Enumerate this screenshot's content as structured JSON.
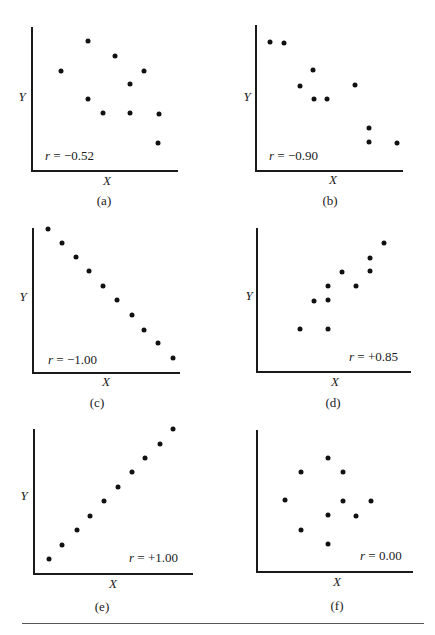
{
  "chart_data": [
    {
      "id": "a",
      "type": "scatter",
      "caption": "(a)",
      "xlabel": "X",
      "ylabel": "Y",
      "annotation": "r = −0.52",
      "r": -0.52,
      "grid": false,
      "ticks": false,
      "annotation_position": "bottom-left",
      "points": [
        [
          29,
          100
        ],
        [
          56,
          130
        ],
        [
          83,
          115
        ],
        [
          112,
          100
        ],
        [
          98,
          87
        ],
        [
          56,
          72
        ],
        [
          71,
          58
        ],
        [
          98,
          58
        ],
        [
          127,
          57
        ],
        [
          126,
          28
        ]
      ]
    },
    {
      "id": "b",
      "type": "scatter",
      "caption": "(b)",
      "xlabel": "X",
      "ylabel": "Y",
      "annotation": "r = −0.90",
      "r": -0.9,
      "grid": false,
      "ticks": false,
      "annotation_position": "bottom-left",
      "points": [
        [
          14,
          129
        ],
        [
          28,
          128
        ],
        [
          57,
          101
        ],
        [
          44,
          85
        ],
        [
          99,
          86
        ],
        [
          58,
          72
        ],
        [
          71,
          72
        ],
        [
          113,
          43
        ],
        [
          113,
          29
        ],
        [
          141,
          28
        ]
      ]
    },
    {
      "id": "c",
      "type": "scatter",
      "caption": "(c)",
      "xlabel": "X",
      "ylabel": "Y",
      "annotation": "r = −1.00",
      "r": -1.0,
      "grid": false,
      "ticks": false,
      "annotation_position": "bottom-left",
      "points": [
        [
          15,
          144
        ],
        [
          29,
          130
        ],
        [
          43,
          116
        ],
        [
          56,
          102
        ],
        [
          70,
          87
        ],
        [
          84,
          73
        ],
        [
          99,
          58
        ],
        [
          111,
          43
        ],
        [
          125,
          30
        ],
        [
          140,
          15
        ]
      ]
    },
    {
      "id": "d",
      "type": "scatter",
      "caption": "(d)",
      "xlabel": "X",
      "ylabel": "Y",
      "annotation": "r = +0.85",
      "r": 0.85,
      "grid": false,
      "ticks": false,
      "annotation_position": "bottom-right",
      "points": [
        [
          127,
          129
        ],
        [
          113,
          114
        ],
        [
          113,
          101
        ],
        [
          85,
          100
        ],
        [
          99,
          86
        ],
        [
          71,
          86
        ],
        [
          57,
          71
        ],
        [
          71,
          72
        ],
        [
          43,
          43
        ],
        [
          71,
          43
        ]
      ]
    },
    {
      "id": "e",
      "type": "scatter",
      "caption": "(e)",
      "xlabel": "X",
      "ylabel": "Y",
      "annotation": "r = +1.00",
      "r": 1.0,
      "grid": false,
      "ticks": false,
      "annotation_position": "bottom-right",
      "points": [
        [
          15,
          15
        ],
        [
          28,
          29
        ],
        [
          43,
          44
        ],
        [
          56,
          58
        ],
        [
          70,
          73
        ],
        [
          84,
          87
        ],
        [
          98,
          102
        ],
        [
          111,
          116
        ],
        [
          126,
          130
        ],
        [
          139,
          145
        ]
      ]
    },
    {
      "id": "f",
      "type": "scatter",
      "caption": "(f)",
      "xlabel": "X",
      "ylabel": "",
      "annotation": "r = 0.00",
      "r": 0.0,
      "grid": false,
      "ticks": false,
      "annotation_position": "bottom-right",
      "points": [
        [
          71,
          114
        ],
        [
          44,
          100
        ],
        [
          86,
          100
        ],
        [
          28,
          72
        ],
        [
          86,
          71
        ],
        [
          114,
          71
        ],
        [
          71,
          57
        ],
        [
          99,
          56
        ],
        [
          44,
          42
        ],
        [
          71,
          28
        ]
      ]
    }
  ],
  "panels": {
    "a": {
      "caption": "(a)",
      "xlabel": "X",
      "ylabel": "Y",
      "r_var": "r",
      "r_text": " =  −0.52"
    },
    "b": {
      "caption": "(b)",
      "xlabel": "X",
      "ylabel": "Y",
      "r_var": "r",
      "r_text": "  =  −0.90"
    },
    "c": {
      "caption": "(c)",
      "xlabel": "X",
      "ylabel": "Y",
      "r_var": "r",
      "r_text": " =  −1.00"
    },
    "d": {
      "caption": "(d)",
      "xlabel": "X",
      "ylabel": "Y",
      "r_var": "r",
      "r_text": " =  +0.85"
    },
    "e": {
      "caption": "(e)",
      "xlabel": "X",
      "ylabel": "Y",
      "r_var": "r",
      "r_text": " =  +1.00"
    },
    "f": {
      "caption": "(f)",
      "xlabel": "X",
      "ylabel": "",
      "r_var": "r",
      "r_text": " = 0.00"
    }
  }
}
